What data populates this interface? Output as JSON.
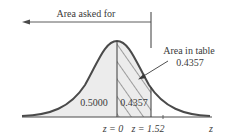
{
  "figure": {
    "type": "standard-normal-curve",
    "arrow_label": "Area asked for",
    "callout_label": "Area in table",
    "callout_value": "0.4357",
    "left_area_value": "0.5000",
    "middle_area_value": "0.4357",
    "axis_labels": {
      "z0": "z = 0",
      "z1": "z = 1.52",
      "axis": "z"
    },
    "colors": {
      "curve": "#4a4a4a",
      "shade": "#ececec",
      "hatch": "#3a3a3a",
      "text": "#3a3a3a"
    }
  }
}
